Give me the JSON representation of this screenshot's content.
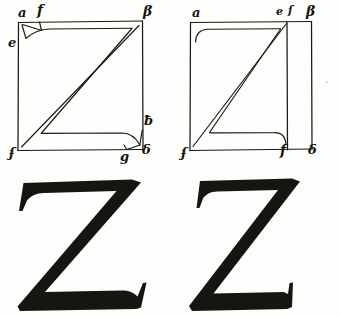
{
  "page": {
    "background_color": "#fdfdfc",
    "ink_color": "#17150f",
    "width": 341,
    "height": 317
  },
  "plates": [
    {
      "id": "plate-left",
      "name": "construction-z-wide",
      "description": "Square construction grid for a wide capital Z with curved serif brackets at the upper-left and lower-right",
      "square": {
        "x": 18,
        "y": 22,
        "width": 124,
        "height": 128
      },
      "labels": [
        {
          "key": "a",
          "text": "a",
          "x": 18,
          "y": 6,
          "size": "lbl-md"
        },
        {
          "key": "f",
          "text": "f",
          "x": 37,
          "y": 3,
          "size": "lbl-lg"
        },
        {
          "key": "b",
          "text": "β",
          "x": 143,
          "y": 4,
          "size": "lbl-lg"
        },
        {
          "key": "e",
          "text": "e",
          "x": 8,
          "y": 36,
          "size": "lbl-md"
        },
        {
          "key": "h",
          "text": "ƀ",
          "x": 144,
          "y": 114,
          "size": "lbl-md"
        },
        {
          "key": "c",
          "text": "ʄ",
          "x": 9,
          "y": 146,
          "size": "lbl-md"
        },
        {
          "key": "g",
          "text": "g",
          "x": 120,
          "y": 150,
          "size": "lbl-md"
        },
        {
          "key": "d",
          "text": "δ",
          "x": 142,
          "y": 143,
          "size": "lbl-md"
        }
      ],
      "glyph": {
        "name": "letter-z-wide",
        "letter": "Z"
      }
    },
    {
      "id": "plate-right",
      "name": "construction-z-narrow",
      "description": "Square construction grid for a narrow capital Z, the letter body stopping short of the right edge leaving a vertical margin strip",
      "square": {
        "x": 20,
        "y": 22,
        "width": 122,
        "height": 128
      },
      "inner_right_x": 117,
      "labels": [
        {
          "key": "a",
          "text": "a",
          "x": 22,
          "y": 6,
          "size": "lbl-md"
        },
        {
          "key": "e",
          "text": "e",
          "x": 106,
          "y": 6,
          "size": "lbl-sm"
        },
        {
          "key": "s",
          "text": "ſ",
          "x": 118,
          "y": 5,
          "size": "lbl-sm"
        },
        {
          "key": "b",
          "text": "β",
          "x": 136,
          "y": 4,
          "size": "lbl-lg"
        },
        {
          "key": "c",
          "text": "ʄ",
          "x": 11,
          "y": 146,
          "size": "lbl-md"
        },
        {
          "key": "f",
          "text": "f",
          "x": 110,
          "y": 143,
          "size": "lbl-lg"
        },
        {
          "key": "d",
          "text": "δ",
          "x": 138,
          "y": 143,
          "size": "lbl-md"
        }
      ],
      "glyph": {
        "name": "letter-z-narrow",
        "letter": "Z"
      }
    }
  ],
  "marks": [
    {
      "name": "paper-speck",
      "x": 326,
      "y": 81
    }
  ]
}
